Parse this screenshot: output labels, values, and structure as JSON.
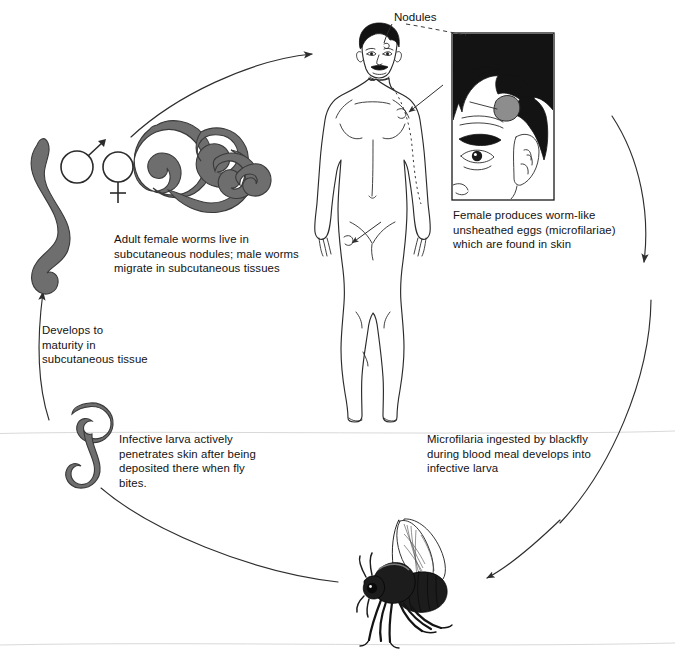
{
  "diagram": {
    "type": "lifecycle-diagram",
    "background_color": "#ffffff",
    "ink_color": "#121212",
    "worm_color": "#6e6e6e"
  },
  "labels": {
    "nodules": "Nodules",
    "adult_worms": "Adult female worms live in\nsubcutaneous nodules; male worms\nmigrate in subcutaneous tissues",
    "female_eggs": "Female produces worm-like\nunsheathed eggs (microfilariae)\nwhich are found in skin",
    "microfilaria_ingested": "Microfilaria ingested by blackfly\nduring blood meal develops into\ninfective larva",
    "infective_larva": "Infective larva actively\npenetrates skin after being\ndeposited there when fly\nbites.",
    "develops_maturity": "Developes to\nmaturity in\nsubcutaneous tissue"
  },
  "label_text_fixed": {
    "develops_maturity": "Develops to\nmaturity in\nsubcutaneous tissue"
  },
  "figures": {
    "human": "adult-male-human-body-front-view-with-nodules",
    "inset": "close-up-of-face-showing-nodule-above-eye",
    "male_worm": "male-worm-wavy",
    "female_worm": "female-worm-coiled",
    "larva": "infective-larva-s-shaped",
    "blackfly": "blackfly-simulium",
    "male_symbol": "mars-symbol",
    "female_symbol": "venus-symbol"
  },
  "arrows": {
    "larva_to_human": "arc-arrow-left-to-top",
    "human_to_fly": "arc-arrow-right-down",
    "fly_intake": "arc-arrow-to-fly",
    "fly_to_larva": "arc-curve-bottom-left",
    "larva_to_adult": "arrow-up-left"
  }
}
